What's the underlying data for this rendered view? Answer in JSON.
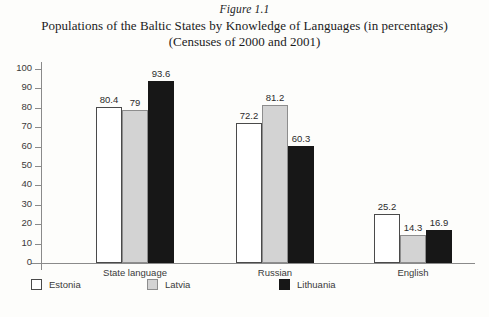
{
  "figure": {
    "number": "Figure 1.1",
    "title_line1": "Populations of the Baltic States by Knowledge of Languages (in percentages)",
    "title_line2": "(Censuses of 2000 and 2001)"
  },
  "chart_data": {
    "type": "bar",
    "title": "Populations of the Baltic States by Knowledge of Languages (in percentages) (Censuses of 2000 and 2001)",
    "xlabel": "",
    "ylabel": "",
    "ylim": [
      0,
      100
    ],
    "yticks": [
      0,
      10,
      20,
      30,
      40,
      50,
      60,
      70,
      80,
      90,
      100
    ],
    "grid": false,
    "legend_position": "bottom-left",
    "categories": [
      "State language",
      "Russian",
      "English"
    ],
    "series": [
      {
        "name": "Estonia",
        "color": "#ffffff",
        "values": [
          80.4,
          72.2,
          25.2
        ],
        "labels": [
          "80.4",
          "72.2",
          "25.2"
        ]
      },
      {
        "name": "Latvia",
        "color": "#d3d3d3",
        "values": [
          79,
          81.2,
          14.3
        ],
        "labels": [
          "79",
          "81.2",
          "14.3"
        ]
      },
      {
        "name": "Lithuania",
        "color": "#171717",
        "values": [
          93.6,
          60.3,
          16.9
        ],
        "labels": [
          "93.6",
          "60.3",
          "16.9"
        ]
      }
    ]
  }
}
